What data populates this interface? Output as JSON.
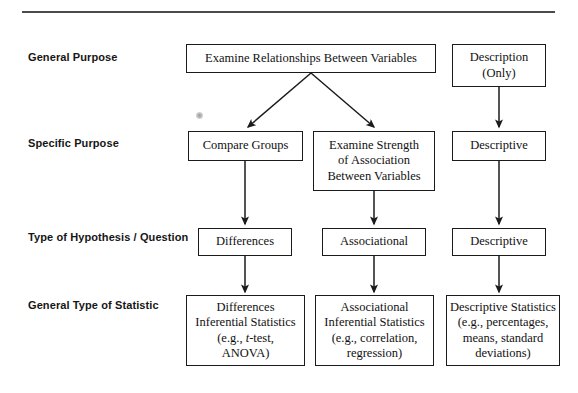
{
  "figure": {
    "top_rule": true,
    "accent_color": "#4a4a4d",
    "line_color": "#1b1b1b"
  },
  "row_labels": [
    {
      "key": "general_purpose",
      "text": "General Purpose"
    },
    {
      "key": "specific_purpose",
      "text": "Specific Purpose"
    },
    {
      "key": "type_of_hypothesis",
      "text": "Type of Hypothesis / Question"
    },
    {
      "key": "general_type_of_statistic",
      "text": "General Type of Statistic"
    }
  ],
  "nodes": {
    "examine_relationships": {
      "line1": "Examine Relationships Between Variables"
    },
    "description_only": {
      "line1": "Description",
      "line2": "(Only)"
    },
    "compare_groups": {
      "line1": "Compare Groups"
    },
    "examine_strength": {
      "line1": "Examine Strength",
      "line2": "of Association",
      "line3": "Between Variables"
    },
    "descriptive_specific": {
      "line1": "Descriptive"
    },
    "differences": {
      "line1": "Differences"
    },
    "associational": {
      "line1": "Associational"
    },
    "descriptive_hypothesis": {
      "line1": "Descriptive"
    },
    "differences_inferential": {
      "line1": "Differences",
      "line2": "Inferential Statistics",
      "line3a": "(e.g., ",
      "line3b": "t",
      "line3c": "-test,",
      "line4": "ANOVA)"
    },
    "associational_inferential": {
      "line1": "Associational",
      "line2": "Inferential Statistics",
      "line3": "(e.g., correlation,",
      "line4": "regression)"
    },
    "descriptive_statistics": {
      "line1": "Descriptive Statistics",
      "line2": "(e.g., percentages,",
      "line3": "means, standard",
      "line4": "deviations)"
    }
  }
}
